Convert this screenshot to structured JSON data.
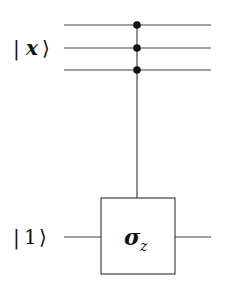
{
  "diagram": {
    "type": "quantum-circuit",
    "inputs": [
      {
        "label_bar": "|",
        "label_var": "x",
        "label_close": "⟩",
        "wires": 3
      },
      {
        "label_bar": "|",
        "label_var": "1",
        "label_close": "⟩",
        "wires": 1
      }
    ],
    "gate": {
      "name": "controlled-sigma-z",
      "symbol": "σ",
      "subscript": "z",
      "controls": 3,
      "target_wire": 4
    },
    "colors": {
      "line": "#333333",
      "dot": "#111111",
      "background": "#ffffff"
    }
  }
}
